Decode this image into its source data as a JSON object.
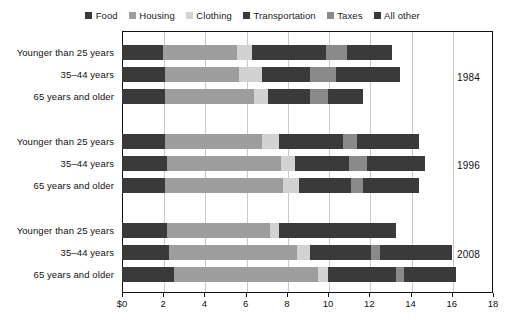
{
  "legend": {
    "entries": [
      {
        "label": "Food",
        "color": "#3a3a3a"
      },
      {
        "label": "Housing",
        "color": "#9e9e9e"
      },
      {
        "label": "Clothing",
        "color": "#d2d2d2"
      },
      {
        "label": "Transportation",
        "color": "#3a3a3a"
      },
      {
        "label": "Taxes",
        "color": "#8a8a8a"
      },
      {
        "label": "All other",
        "color": "#3a3a3a"
      }
    ]
  },
  "annotations": {
    "year_1984": "1984",
    "year_1996": "1996",
    "year_2008": "2008"
  },
  "chart_data": {
    "type": "bar",
    "subtype": "stacked-horizontal-grouped",
    "title": "",
    "xlabel": "",
    "ylabel": "",
    "xlim": [
      0,
      18
    ],
    "xticks": [
      0,
      2,
      4,
      6,
      8,
      10,
      12,
      14,
      16,
      18
    ],
    "xticklabels": [
      "$0",
      "2",
      "4",
      "6",
      "8",
      "10",
      "12",
      "14",
      "16",
      "18"
    ],
    "grid": true,
    "grid_axis": "x",
    "legend_position": "top-center",
    "series": [
      {
        "name": "Food",
        "color": "#3a3a3a"
      },
      {
        "name": "Housing",
        "color": "#9e9e9e"
      },
      {
        "name": "Clothing",
        "color": "#d2d2d2"
      },
      {
        "name": "Transportation",
        "color": "#3a3a3a"
      },
      {
        "name": "Taxes",
        "color": "#8a8a8a"
      },
      {
        "name": "All other",
        "color": "#3a3a3a"
      }
    ],
    "groups": [
      {
        "year": "1984",
        "bars": [
          {
            "category": "Younger than 25 years",
            "values": [
              2.0,
              3.6,
              0.7,
              3.6,
              1.0,
              2.2
            ],
            "total": 13.1
          },
          {
            "category": "35–44 years",
            "values": [
              2.1,
              3.6,
              1.1,
              2.3,
              1.3,
              3.1
            ],
            "total": 13.5
          },
          {
            "category": "65 years and older",
            "values": [
              2.1,
              4.3,
              0.7,
              2.0,
              0.9,
              1.7
            ],
            "total": 11.7
          }
        ]
      },
      {
        "year": "1996",
        "bars": [
          {
            "category": "Younger than 25 years",
            "values": [
              2.1,
              4.7,
              0.8,
              3.1,
              0.7,
              3.0
            ],
            "total": 14.4
          },
          {
            "category": "35–44 years",
            "values": [
              2.2,
              5.5,
              0.7,
              2.6,
              0.9,
              2.8
            ],
            "total": 14.7
          },
          {
            "category": "65 years and older",
            "values": [
              2.1,
              5.7,
              0.8,
              2.5,
              0.6,
              2.7
            ],
            "total": 14.4
          }
        ]
      },
      {
        "year": "2008",
        "bars": [
          {
            "category": "Younger than 25 years",
            "values": [
              2.2,
              5.0,
              0.4,
              2.6,
              0.0,
              3.1
            ],
            "total": 13.3
          },
          {
            "category": "35–44 years",
            "values": [
              2.3,
              6.2,
              0.6,
              3.0,
              0.4,
              3.5
            ],
            "total": 16.0
          },
          {
            "category": "65 years and older",
            "values": [
              2.5,
              7.0,
              0.5,
              3.3,
              0.4,
              2.5
            ],
            "total": 16.2
          }
        ]
      }
    ]
  }
}
